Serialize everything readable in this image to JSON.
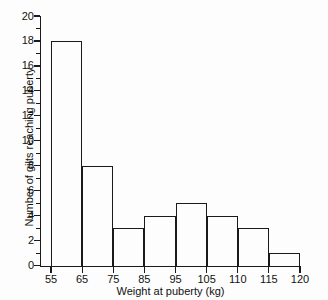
{
  "chart_data": {
    "type": "bar",
    "title": "",
    "subtitle": "",
    "xlabel": "Weight at puberty (kg)",
    "ylabel": "Number of gilts reaching puberty",
    "xlim": [
      55,
      120
    ],
    "ylim": [
      0,
      20
    ],
    "grid": false,
    "legend": null,
    "x_tick_labels": [
      "55",
      "65",
      "75",
      "85",
      "95",
      "105",
      "110",
      "115",
      "120"
    ],
    "x_tick_values": [
      55,
      65,
      75,
      85,
      95,
      105,
      110,
      115,
      120
    ],
    "y_tick_labels": [
      "0",
      "2",
      "4",
      "6",
      "8",
      "10",
      "12",
      "14",
      "16",
      "18",
      "20"
    ],
    "y_tick_values": [
      0,
      2,
      4,
      6,
      8,
      10,
      12,
      14,
      16,
      18,
      20
    ],
    "y_minor_tick_values": [
      1,
      3,
      5,
      7,
      9,
      11,
      13,
      15,
      17,
      19
    ],
    "bin_edges": [
      55,
      65,
      75,
      85,
      95,
      105,
      110,
      115,
      120
    ],
    "categories": [
      "55-65",
      "65-75",
      "75-85",
      "85-95",
      "95-105",
      "105-110",
      "110-115",
      "115-120"
    ],
    "values": [
      18,
      8,
      3,
      4,
      5,
      4,
      3,
      1
    ],
    "note": "bins plotted at equal visual width although last three intervals span 5 kg",
    "bar_fill": "none",
    "bar_edge_color": "#1a1a1a",
    "background_color": "#fdfdfd"
  }
}
